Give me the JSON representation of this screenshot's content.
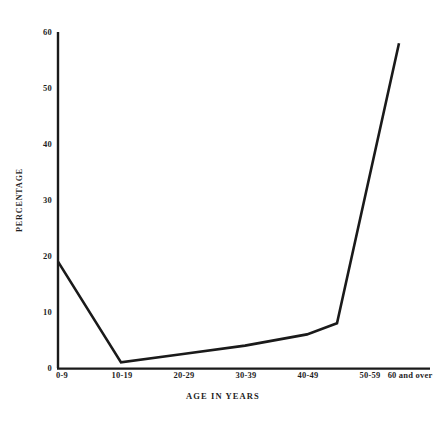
{
  "chart_data": {
    "type": "line",
    "title": "",
    "subtitle": "",
    "xlabel": "AGE IN YEARS",
    "ylabel": "PERCENTAGE",
    "categories": [
      "0-9",
      "10-19",
      "20-29",
      "30-39",
      "40-49",
      "50-59",
      "60 and over"
    ],
    "values": [
      19,
      1,
      2.5,
      4,
      6,
      8,
      58
    ],
    "series": [
      {
        "name": "Percentage",
        "values": [
          19,
          1,
          2.5,
          4,
          6,
          8,
          58
        ]
      }
    ],
    "ylim": [
      0,
      60
    ],
    "yticks": [
      0,
      10,
      20,
      30,
      40,
      50,
      60
    ],
    "ytick_labels": [
      "0",
      "10",
      "20",
      "30",
      "40",
      "50",
      "60"
    ],
    "grid": false,
    "legend": false,
    "legend_position": "none",
    "annotations": [],
    "line_color": "#1a1a1a",
    "axis_color": "#1a1a1a",
    "background_color": "#ffffff",
    "markers": false
  },
  "axis": {
    "y_title": "PERCENTAGE",
    "x_title": "AGE IN YEARS"
  }
}
